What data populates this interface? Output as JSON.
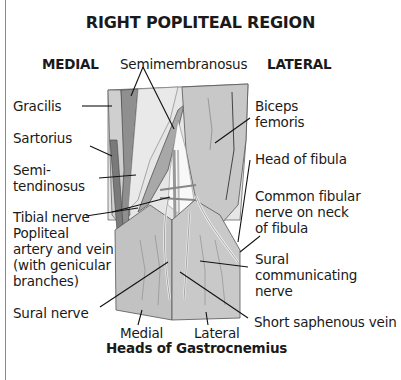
{
  "title": "RIGHT POPLITEAL REGION",
  "orientation": {
    "left": "MEDIAL",
    "right": "LATERAL"
  },
  "labels": {
    "semimembranosus": "Semimembranosus",
    "gracilis": "Gracilis",
    "sartorius": "Sartorius",
    "semitendinosus_1": "Semi-",
    "semitendinosus_2": "tendinosus",
    "tibial_nerve": "Tibial nerve",
    "popliteal_1": "Popliteal",
    "popliteal_2": "artery and vein",
    "popliteal_3": "(with genicular",
    "popliteal_4": "branches)",
    "sural_nerve": "Sural nerve",
    "biceps_1": "Biceps",
    "biceps_2": "femoris",
    "head_fibula": "Head of fibula",
    "common_fibular_1": "Common fibular",
    "common_fibular_2": "nerve on neck",
    "common_fibular_3": "of fibula",
    "sural_comm_1": "Sural",
    "sural_comm_2": "communicating",
    "sural_comm_3": "nerve",
    "short_saphenous": "Short saphenous vein",
    "gastro_medial": "Medial",
    "gastro_lateral": "Lateral",
    "gastro_heads": "Heads of Gastrocnemius"
  },
  "colors": {
    "muscle_light": "#d4d4d4",
    "muscle_mid": "#b9b9b9",
    "muscle_dark": "#8f8f8f",
    "fossa": "#eeeeee",
    "outline": "#4a4a4a",
    "leader": "#111111"
  }
}
